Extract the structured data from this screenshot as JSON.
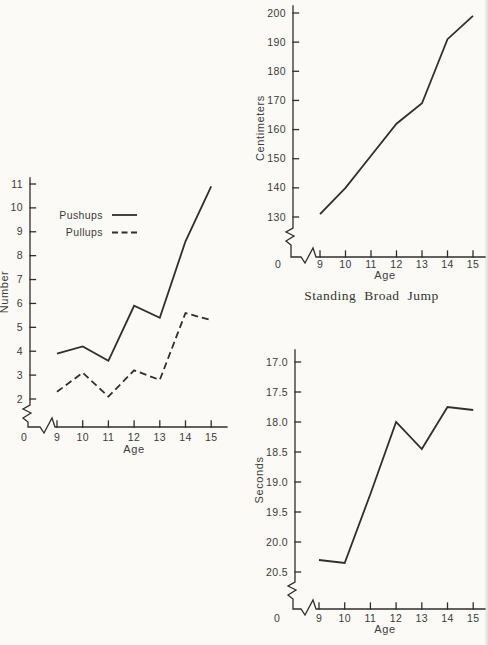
{
  "page": {
    "paper_color": "#fbfaf7",
    "ink_color": "#2f2f2f"
  },
  "chart_data": [
    {
      "id": "exercise",
      "type": "line",
      "xlabel": "Age",
      "ylabel": "Number",
      "origin_label": "0",
      "x": [
        9,
        10,
        11,
        12,
        13,
        14,
        15
      ],
      "yticks": [
        "11",
        "10",
        "9",
        "8",
        "7",
        "6",
        "5",
        "4",
        "3",
        "2"
      ],
      "ylim_top_to_bottom": [
        11,
        2
      ],
      "x_axis_break": true,
      "y_axis_break": true,
      "grid": false,
      "legend": {
        "position": "upper-left-inside",
        "entries": [
          {
            "label": "Pushups",
            "line": "solid"
          },
          {
            "label": "Pullups",
            "line": "dashed"
          }
        ]
      },
      "series": [
        {
          "name": "Pushups",
          "line": "solid",
          "values": [
            3.9,
            4.2,
            3.6,
            5.9,
            5.4,
            8.6,
            10.9
          ]
        },
        {
          "name": "Pullups",
          "line": "dashed",
          "values": [
            2.3,
            3.1,
            2.1,
            3.2,
            2.8,
            5.6,
            5.3
          ]
        }
      ]
    },
    {
      "id": "broadjump",
      "type": "line",
      "title": "Standing Broad Jump",
      "title_position": "below-chart",
      "xlabel": "Age",
      "ylabel": "Centimeters",
      "origin_label": "0",
      "x": [
        9,
        10,
        11,
        12,
        13,
        14,
        15
      ],
      "yticks": [
        "200",
        "190",
        "180",
        "170",
        "160",
        "150",
        "140",
        "130"
      ],
      "ylim_top_to_bottom": [
        200,
        130
      ],
      "x_axis_break": true,
      "y_axis_break": true,
      "grid": false,
      "series": [
        {
          "name": "Standing Broad Jump",
          "line": "solid",
          "values": [
            131,
            140,
            151,
            162,
            169,
            191,
            199
          ]
        }
      ]
    },
    {
      "id": "dashtime",
      "type": "line",
      "xlabel": "Age",
      "ylabel": "Seconds",
      "origin_label": "0",
      "x": [
        9,
        10,
        11,
        12,
        13,
        14,
        15
      ],
      "yticks": [
        "17.0",
        "17.5",
        "18.0",
        "18.5",
        "19.0",
        "19.5",
        "20.0",
        "20.5"
      ],
      "ylim_top_to_bottom": [
        17.0,
        20.5
      ],
      "y_axis_inverted": true,
      "x_axis_break": true,
      "y_axis_break": true,
      "grid": false,
      "series": [
        {
          "name": "Running time",
          "line": "solid",
          "values": [
            20.3,
            20.35,
            19.2,
            18.0,
            18.45,
            17.75,
            17.8
          ]
        }
      ]
    }
  ]
}
